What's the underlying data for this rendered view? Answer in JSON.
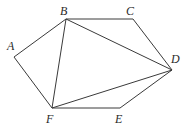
{
  "diagram": {
    "type": "hexagon-with-diagonals",
    "vertices": {
      "A": {
        "x": 14,
        "y": 57,
        "label": "A",
        "lx": 7,
        "ly": 50
      },
      "B": {
        "x": 66,
        "y": 19,
        "label": "B",
        "lx": 60,
        "ly": 15
      },
      "C": {
        "x": 133,
        "y": 19,
        "label": "C",
        "lx": 126,
        "ly": 15
      },
      "D": {
        "x": 172,
        "y": 70,
        "label": "D",
        "lx": 171,
        "ly": 63
      },
      "E": {
        "x": 120,
        "y": 108,
        "label": "E",
        "lx": 115,
        "ly": 123
      },
      "F": {
        "x": 52,
        "y": 108,
        "label": "F",
        "lx": 46,
        "ly": 123
      }
    },
    "edges": [
      [
        "A",
        "B"
      ],
      [
        "B",
        "C"
      ],
      [
        "C",
        "D"
      ],
      [
        "D",
        "E"
      ],
      [
        "E",
        "F"
      ],
      [
        "F",
        "A"
      ],
      [
        "B",
        "F"
      ],
      [
        "B",
        "D"
      ],
      [
        "F",
        "D"
      ]
    ],
    "stroke_color": "#3a3a3a",
    "label_color": "#2a2a2a"
  }
}
